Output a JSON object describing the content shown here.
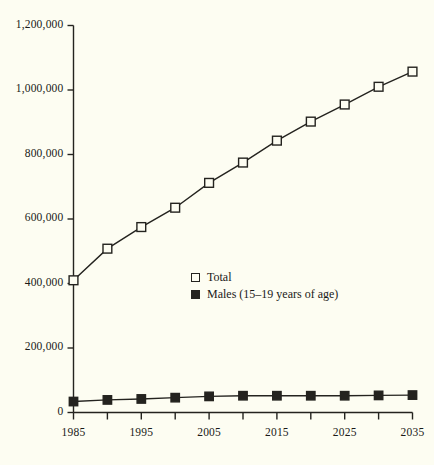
{
  "chart_data": {
    "type": "line",
    "title": "",
    "subtitle": "",
    "xlabel": "",
    "ylabel": "",
    "x": [
      1985,
      1990,
      1995,
      2000,
      2005,
      2010,
      2015,
      2020,
      2025,
      2030,
      2035
    ],
    "xlim": [
      1985,
      2035
    ],
    "ylim": [
      0,
      1200000
    ],
    "grid": false,
    "legend_position": "center",
    "x_tick_values": [
      1985,
      1990,
      1995,
      2000,
      2005,
      2010,
      2015,
      2020,
      2025,
      2030,
      2035
    ],
    "x_tick_labels": [
      "1985",
      "",
      "1995",
      "",
      "2005",
      "",
      "2015",
      "",
      "2025",
      "",
      "2035"
    ],
    "x_labeled_ticks": [
      {
        "value": 1985,
        "label": "1985"
      },
      {
        "value": 1995,
        "label": "1995"
      },
      {
        "value": 2005,
        "label": "2005"
      },
      {
        "value": 2015,
        "label": "2015"
      },
      {
        "value": 2025,
        "label": "2025"
      },
      {
        "value": 2035,
        "label": "2035"
      }
    ],
    "y_ticks": [
      {
        "value": 0,
        "label": "0"
      },
      {
        "value": 200000,
        "label": "200,000"
      },
      {
        "value": 400000,
        "label": "400,000"
      },
      {
        "value": 600000,
        "label": "600,000"
      },
      {
        "value": 800000,
        "label": "800,000"
      },
      {
        "value": 1000000,
        "label": "1,000,000"
      },
      {
        "value": 1200000,
        "label": "1,200,000"
      }
    ],
    "series": [
      {
        "name": "Total",
        "marker": "open-square",
        "color": "#24231f",
        "values": [
          410000,
          508000,
          575000,
          635000,
          712000,
          775000,
          843000,
          902000,
          955000,
          1010000,
          1057000
        ]
      },
      {
        "name": "Males (15–19 years of age)",
        "marker": "filled-square",
        "color": "#24231f",
        "values": [
          34000,
          39000,
          42000,
          46000,
          50000,
          52000,
          52000,
          52000,
          52000,
          53000,
          54000
        ]
      }
    ]
  },
  "legend": {
    "entries": [
      {
        "label": "Total",
        "marker": "open-square"
      },
      {
        "label": "Males (15–19 years of age)",
        "marker": "filled-square"
      }
    ]
  },
  "colors": {
    "background": "#fdfdf2",
    "ink": "#24231f",
    "line": "#2b2a25"
  }
}
